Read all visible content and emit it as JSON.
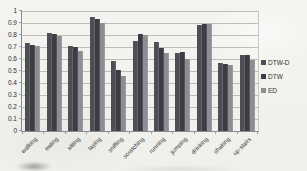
{
  "chart_data": {
    "type": "bar",
    "title": "",
    "xlabel": "",
    "ylabel": "",
    "categories": [
      "walking",
      "eating",
      "sitting",
      "laying",
      "sniffing",
      "scratching",
      "running",
      "jumping",
      "drinking",
      "shaking",
      "up-stairs"
    ],
    "series": [
      {
        "name": "DTW-D",
        "color": "#4e4e55",
        "values": [
          0.73,
          0.82,
          0.71,
          0.95,
          0.58,
          0.75,
          0.74,
          0.65,
          0.88,
          0.57,
          0.63
        ]
      },
      {
        "name": "DTW",
        "color": "#3c3c42",
        "values": [
          0.72,
          0.81,
          0.7,
          0.93,
          0.51,
          0.81,
          0.69,
          0.66,
          0.89,
          0.56,
          0.63
        ]
      },
      {
        "name": "ED",
        "color": "#8d8d93",
        "values": [
          0.71,
          0.79,
          0.67,
          0.9,
          0.46,
          0.8,
          0.65,
          0.6,
          0.89,
          0.55,
          0.59
        ]
      }
    ],
    "ylim": [
      0,
      1
    ],
    "ytick_step": 0.1,
    "ytick_labels_bottom_to_top": [
      "0",
      "0.1",
      "0.2",
      "0.3",
      "0.4",
      "0.5",
      "0.6",
      "0.7",
      "0.8",
      "0.9",
      "1"
    ],
    "grid": true,
    "legend_position": "right"
  },
  "colors": {
    "background": "#f2f2ef",
    "gridline": "#bcbcb9",
    "axis": "#8a8a88",
    "text": "#2f2f2f"
  }
}
